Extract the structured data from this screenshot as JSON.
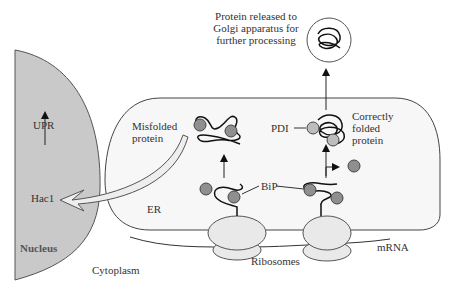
{
  "labels": {
    "golgi_caption": [
      "Protein released to",
      "Golgi apparatus for",
      "further processing"
    ],
    "upr": "UPR",
    "hac1": "Hac1",
    "nucleus": "Nucleus",
    "misfolded": [
      "Misfolded",
      "protein"
    ],
    "correct": [
      "Correctly",
      "folded",
      "protein"
    ],
    "pdi": "PDI",
    "bip": "BiP",
    "er": "ER",
    "mrna": "mRNA",
    "ribosomes": "Ribosomes",
    "cytoplasm": "Cytoplasm"
  },
  "colors": {
    "nucleus_fill": "#c9c9c9",
    "er_fill": "#f7f7f7",
    "ribosome_fill": "#e9e9e9",
    "bip_fill": "#8f8f8f",
    "pdi_fill": "#bdbdbd",
    "line": "#222222"
  }
}
